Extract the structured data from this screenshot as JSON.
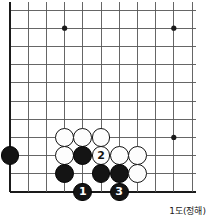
{
  "diagram": {
    "kind": "go-board-diagram",
    "caption": "1도(정해)",
    "board": {
      "columns": 11,
      "rows": 11,
      "line_color": "#555555",
      "edge_color": "#1a1a1a",
      "background": "#ffffff",
      "origin_x": 10,
      "origin_y": 10,
      "spacing": 18.2,
      "show_grid": true,
      "edges": {
        "left": true,
        "bottom": true,
        "top": false,
        "right": false
      }
    },
    "star_points": [
      {
        "col": 4,
        "row": 2
      },
      {
        "col": 10,
        "row": 2
      },
      {
        "col": 10,
        "row": 8
      }
    ],
    "stones": [
      {
        "col": 4,
        "row": 8,
        "color": "white",
        "label": ""
      },
      {
        "col": 5,
        "row": 8,
        "color": "white",
        "label": ""
      },
      {
        "col": 6,
        "row": 8,
        "color": "white",
        "label": ""
      },
      {
        "col": 1,
        "row": 9,
        "color": "black",
        "label": ""
      },
      {
        "col": 4,
        "row": 9,
        "color": "white",
        "label": ""
      },
      {
        "col": 5,
        "row": 9,
        "color": "black",
        "label": ""
      },
      {
        "col": 6,
        "row": 9,
        "color": "white",
        "label": "2"
      },
      {
        "col": 7,
        "row": 9,
        "color": "white",
        "label": ""
      },
      {
        "col": 8,
        "row": 9,
        "color": "white",
        "label": ""
      },
      {
        "col": 4,
        "row": 10,
        "color": "black",
        "label": ""
      },
      {
        "col": 6,
        "row": 10,
        "color": "black",
        "label": ""
      },
      {
        "col": 7,
        "row": 10,
        "color": "black",
        "label": ""
      },
      {
        "col": 8,
        "row": 10,
        "color": "white",
        "label": ""
      },
      {
        "col": 5,
        "row": 11,
        "color": "black",
        "label": "1"
      },
      {
        "col": 7,
        "row": 11,
        "color": "black",
        "label": "3"
      }
    ],
    "move_sequence": [
      {
        "number": 1,
        "color": "black",
        "col": 5,
        "row": 11
      },
      {
        "number": 2,
        "color": "white",
        "col": 6,
        "row": 9
      },
      {
        "number": 3,
        "color": "black",
        "col": 7,
        "row": 11
      }
    ]
  }
}
